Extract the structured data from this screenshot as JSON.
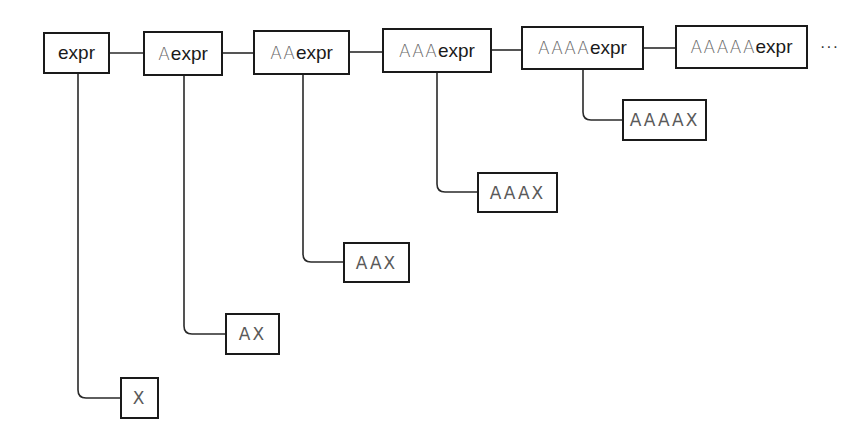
{
  "diagram": {
    "top_nodes": [
      {
        "prefix": "",
        "suffix": "expr"
      },
      {
        "prefix": "A",
        "suffix": "expr"
      },
      {
        "prefix": "AA",
        "suffix": "expr"
      },
      {
        "prefix": "AAA",
        "suffix": "expr"
      },
      {
        "prefix": "AAAA",
        "suffix": "expr"
      },
      {
        "prefix": "AAAAA",
        "suffix": "expr"
      }
    ],
    "leaf_nodes": [
      {
        "label": "X"
      },
      {
        "label": "AX"
      },
      {
        "label": "AAX"
      },
      {
        "label": "AAAX"
      },
      {
        "label": "AAAAX"
      }
    ],
    "continuation": "···",
    "colors": {
      "stroke": "#1a1a1a",
      "prefix_text": "#6a6a6a",
      "leaf_text": "#5a5a5a",
      "background": "#ffffff"
    }
  }
}
